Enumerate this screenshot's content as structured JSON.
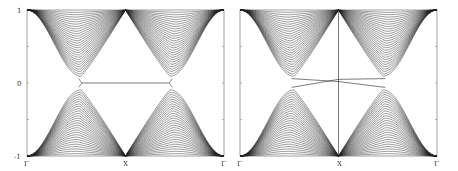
{
  "chart_data": [
    {
      "type": "line",
      "title": "",
      "panel": "left",
      "xlabel": "",
      "ylabel": "",
      "x_ticks": [
        "Γ",
        "X",
        "Γ"
      ],
      "y_ticks": [
        "-1",
        "0",
        "1"
      ],
      "ylim": [
        -1,
        1
      ],
      "grid": false,
      "description": "Band structure: many bulk bands converging at X to ±1, with a gapped region; flat edge state at E=0 spanning between the gap edges",
      "num_bands_per_half": 28,
      "edge_state": {
        "type": "flat",
        "energy": 0,
        "k_range": [
          0.45,
          0.88
        ]
      }
    },
    {
      "type": "line",
      "title": "",
      "panel": "right",
      "xlabel": "",
      "ylabel": "",
      "x_ticks": [
        "Γ",
        "X",
        "Γ"
      ],
      "y_ticks": [],
      "ylim": [
        -1,
        1
      ],
      "grid": false,
      "description": "Band structure with dispersive edge states crossing near X; vertical line at X",
      "num_bands_per_half": 28,
      "edge_state": {
        "type": "crossing",
        "energy_at_X": 0.04
      }
    }
  ],
  "labels": {
    "y_top": "1",
    "y_mid": "0",
    "y_bottom": "-1",
    "gamma": "Γ",
    "x_point": "X"
  },
  "colors": {
    "line": "#222222",
    "frame": "#888888"
  }
}
